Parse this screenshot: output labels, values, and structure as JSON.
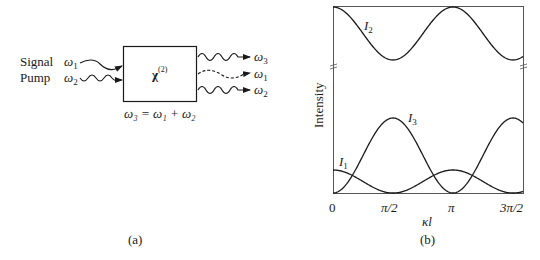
{
  "panel_a": {
    "caption": "(a)",
    "inputs": [
      {
        "label": "Signal",
        "freq": "ω",
        "sub": "1",
        "wave": "smooth"
      },
      {
        "label": "Pump",
        "freq": "ω",
        "sub": "2",
        "wave": "wavy"
      }
    ],
    "box_label": "χ",
    "box_sup": "(2)",
    "outputs": [
      {
        "freq": "ω",
        "sub": "3",
        "style": "wavy"
      },
      {
        "freq": "ω",
        "sub": "1",
        "style": "dashed"
      },
      {
        "freq": "ω",
        "sub": "2",
        "style": "wavy"
      }
    ],
    "equation": "ω₃ = ω₁ + ω₂"
  },
  "panel_b": {
    "caption": "(b)",
    "ylabel": "Intensity",
    "xlabel": "κl",
    "x_ticks": [
      "0",
      "π/2",
      "π",
      "3π/2"
    ],
    "curve_labels": {
      "I1": "I",
      "I1_sub": "1",
      "I2": "I",
      "I2_sub": "2",
      "I3": "I",
      "I3_sub": "3"
    }
  },
  "chart_data": {
    "type": "line",
    "title": "",
    "xlabel": "κl",
    "ylabel": "Intensity",
    "x_ticks": [
      "0",
      "π/2",
      "π",
      "3π/2"
    ],
    "xlim": [
      0,
      1.59
    ],
    "x_units": "π",
    "broken_y_axis": true,
    "series": [
      {
        "name": "I2",
        "description": "pump; cos²-like oscillation near top, max at 0, π; min at π/2, 3π/2",
        "x": [
          0,
          0.25,
          0.5,
          0.75,
          1.0,
          1.25,
          1.5
        ],
        "values": [
          1.0,
          0.5,
          0.0,
          0.5,
          1.0,
          0.5,
          0.0
        ]
      },
      {
        "name": "I3",
        "description": "sum frequency; max at π/2, 3π/2; zero at 0, π",
        "x": [
          0,
          0.25,
          0.5,
          0.75,
          1.0,
          1.25,
          1.5
        ],
        "values": [
          0.0,
          0.5,
          1.0,
          0.5,
          0.0,
          0.5,
          1.0
        ]
      },
      {
        "name": "I1",
        "description": "signal; small, max at 0, π; zero at π/2, 3π/2",
        "x": [
          0,
          0.25,
          0.5,
          0.75,
          1.0,
          1.25,
          1.5
        ],
        "values": [
          0.3,
          0.15,
          0.0,
          0.15,
          0.3,
          0.15,
          0.0
        ]
      }
    ]
  }
}
